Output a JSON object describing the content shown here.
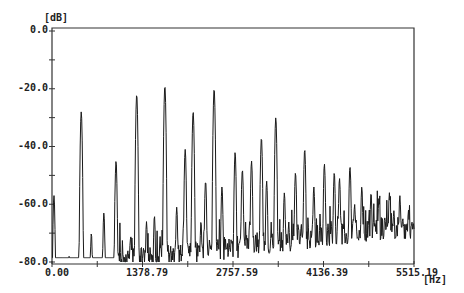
{
  "chart_data": {
    "type": "line",
    "title": "",
    "xlabel": "[Hz]",
    "ylabel": "[dB]",
    "xlim": [
      0.0,
      5515.19
    ],
    "ylim": [
      -80.0,
      0.0
    ],
    "grid": false,
    "legend": null,
    "x_ticks": [
      "0.00",
      "1378.79",
      "2757.59",
      "4136.39",
      "5515.19"
    ],
    "y_ticks": [
      "0.0",
      "-20.0",
      "-40.0",
      "-60.0",
      "-80.0"
    ],
    "series": [
      {
        "name": "spectrum",
        "peaks": [
          {
            "x": 30,
            "y": -57
          },
          {
            "x": 260,
            "y": -78
          },
          {
            "x": 445,
            "y": -28
          },
          {
            "x": 600,
            "y": -70
          },
          {
            "x": 790,
            "y": -63
          },
          {
            "x": 975,
            "y": -45
          },
          {
            "x": 1200,
            "y": -71
          },
          {
            "x": 1290,
            "y": -22
          },
          {
            "x": 1440,
            "y": -66
          },
          {
            "x": 1560,
            "y": -64
          },
          {
            "x": 1720,
            "y": -19
          },
          {
            "x": 1900,
            "y": -61
          },
          {
            "x": 2030,
            "y": -41
          },
          {
            "x": 2150,
            "y": -28
          },
          {
            "x": 2270,
            "y": -66
          },
          {
            "x": 2340,
            "y": -52
          },
          {
            "x": 2470,
            "y": -20
          },
          {
            "x": 2590,
            "y": -54
          },
          {
            "x": 2790,
            "y": -42
          },
          {
            "x": 2900,
            "y": -48
          },
          {
            "x": 3040,
            "y": -45
          },
          {
            "x": 3190,
            "y": -37
          },
          {
            "x": 3270,
            "y": -52
          },
          {
            "x": 3410,
            "y": -30
          },
          {
            "x": 3540,
            "y": -56
          },
          {
            "x": 3710,
            "y": -49
          },
          {
            "x": 3850,
            "y": -41
          },
          {
            "x": 3990,
            "y": -54
          },
          {
            "x": 4150,
            "y": -46
          },
          {
            "x": 4300,
            "y": -49
          },
          {
            "x": 4380,
            "y": -51
          },
          {
            "x": 4540,
            "y": -47
          },
          {
            "x": 4610,
            "y": -60
          },
          {
            "x": 4720,
            "y": -54
          },
          {
            "x": 4860,
            "y": -56
          },
          {
            "x": 4980,
            "y": -58
          },
          {
            "x": 5140,
            "y": -56
          },
          {
            "x": 5300,
            "y": -57
          },
          {
            "x": 5430,
            "y": -62
          }
        ],
        "noise_floor": -80.0
      }
    ]
  },
  "axes": {
    "y_unit": "[dB]",
    "x_unit": "[Hz]",
    "y_ticks": [
      "0.0",
      "-20.0",
      "-40.0",
      "-60.0",
      "-80.0"
    ],
    "x_ticks": [
      "0.00",
      "1378.79",
      "2757.59",
      "4136.39",
      "5515.19"
    ]
  },
  "style": {
    "line_color": "#1a1a1a",
    "frame_color": "#333333"
  }
}
